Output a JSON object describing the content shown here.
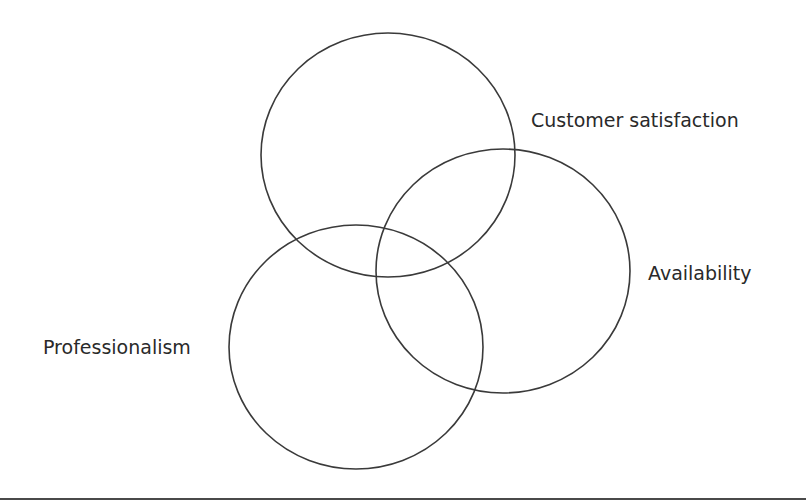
{
  "diagram": {
    "type": "venn",
    "sets": [
      {
        "name": "Customer satisfaction",
        "position": "top"
      },
      {
        "name": "Availability",
        "position": "right"
      },
      {
        "name": "Professionalism",
        "position": "bottom-left"
      }
    ],
    "labels": {
      "customer_satisfaction": "Customer satisfaction",
      "availability": "Availability",
      "professionalism": "Professionalism"
    },
    "colors": {
      "stroke": "#3a3a3a",
      "text": "#2a2a2a",
      "rule": "#4a4a4a",
      "background": "#ffffff"
    }
  }
}
